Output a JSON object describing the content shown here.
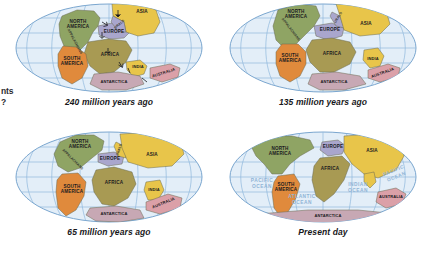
{
  "figure": {
    "title_fragment_left_line1": "nts",
    "title_fragment_left_line2": "?",
    "background_color": "#ffffff"
  },
  "colors": {
    "ocean": "#e3eef8",
    "ocean_edge": "#cfe0f0",
    "graticule": "#8fb8dd",
    "globe_outline": "#7aa6cf",
    "north_america": "#8fa464",
    "south_america": "#e08a3c",
    "africa": "#a89a53",
    "europe": "#a9a6cd",
    "asia": "#e8c54a",
    "india": "#e8c54a",
    "australia": "#dba0a8",
    "antarctica": "#c7a8b4",
    "outline": "#6b6b50",
    "label_text": "#1b1b1f",
    "ocean_label_text": "#8fb4d6"
  },
  "panels": [
    {
      "id": "panel-240ma",
      "caption": "240 million years ago",
      "continents": [
        {
          "name": "NORTH AMERICA",
          "color_key": "north_america"
        },
        {
          "name": "SOUTH AMERICA",
          "color_key": "south_america"
        },
        {
          "name": "AFRICA",
          "color_key": "africa"
        },
        {
          "name": "EUROPE",
          "color_key": "europe"
        },
        {
          "name": "ASIA",
          "color_key": "asia"
        },
        {
          "name": "INDIA",
          "color_key": "india"
        },
        {
          "name": "AUSTRALIA",
          "color_key": "australia"
        },
        {
          "name": "ANTARCTICA",
          "color_key": "antarctica"
        }
      ],
      "annotations": [
        "APPALACHIANS",
        "URALS"
      ],
      "ocean_labels": []
    },
    {
      "id": "panel-135ma",
      "caption": "135 million years ago",
      "continents": [
        {
          "name": "NORTH AMERICA",
          "color_key": "north_america"
        },
        {
          "name": "SOUTH AMERICA",
          "color_key": "south_america"
        },
        {
          "name": "AFRICA",
          "color_key": "africa"
        },
        {
          "name": "EUROPE",
          "color_key": "europe"
        },
        {
          "name": "ASIA",
          "color_key": "asia"
        },
        {
          "name": "INDIA",
          "color_key": "india"
        },
        {
          "name": "AUSTRALIA",
          "color_key": "australia"
        },
        {
          "name": "ANTARCTICA",
          "color_key": "antarctica"
        }
      ],
      "annotations": [
        "APPALACHIANS",
        "URALS"
      ],
      "ocean_labels": []
    },
    {
      "id": "panel-65ma",
      "caption": "65 million years ago",
      "continents": [
        {
          "name": "NORTH AMERICA",
          "color_key": "north_america"
        },
        {
          "name": "SOUTH AMERICA",
          "color_key": "south_america"
        },
        {
          "name": "AFRICA",
          "color_key": "africa"
        },
        {
          "name": "EUROPE",
          "color_key": "europe"
        },
        {
          "name": "ASIA",
          "color_key": "asia"
        },
        {
          "name": "INDIA",
          "color_key": "india"
        },
        {
          "name": "AUSTRALIA",
          "color_key": "australia"
        },
        {
          "name": "ANTARCTICA",
          "color_key": "antarctica"
        }
      ],
      "annotations": [
        "APPALACHIANS",
        "URALS"
      ],
      "ocean_labels": []
    },
    {
      "id": "panel-present",
      "caption": "Present day",
      "continents": [
        {
          "name": "NORTH AMERICA",
          "color_key": "north_america"
        },
        {
          "name": "SOUTH AMERICA",
          "color_key": "south_america"
        },
        {
          "name": "AFRICA",
          "color_key": "africa"
        },
        {
          "name": "EUROPE",
          "color_key": "europe"
        },
        {
          "name": "ASIA",
          "color_key": "asia"
        },
        {
          "name": "AUSTRALIA",
          "color_key": "australia"
        },
        {
          "name": "ANTARCTICA",
          "color_key": "antarctica"
        }
      ],
      "annotations": [],
      "ocean_labels": [
        "PACIFIC OCEAN",
        "ATLANTIC OCEAN",
        "INDIAN OCEAN",
        "PACIFIC OCEAN"
      ]
    }
  ],
  "labels": {
    "north_america": "NORTH\nAMERICA",
    "north_america_l1": "NORTH",
    "north_america_l2": "AMERICA",
    "south_america_l1": "SOUTH",
    "south_america_l2": "AMERICA",
    "africa": "AFRICA",
    "europe": "EUROPE",
    "asia": "ASIA",
    "india": "INDIA",
    "australia": "AUSTRALIA",
    "antarctica": "ANTARCTICA",
    "appalachians": "APPALACHIANS",
    "urals": "URALS",
    "pacific_l1": "PACIFIC",
    "pacific_l2": "OCEAN",
    "atlantic_l1": "ATLANTIC",
    "atlantic_l2": "OCEAN",
    "indian_l1": "INDIAN",
    "indian_l2": "OCEAN"
  },
  "captions": {
    "p1": "240 million years ago",
    "p2": "135 million years ago",
    "p3": "65 million years ago",
    "p4": "Present day"
  }
}
